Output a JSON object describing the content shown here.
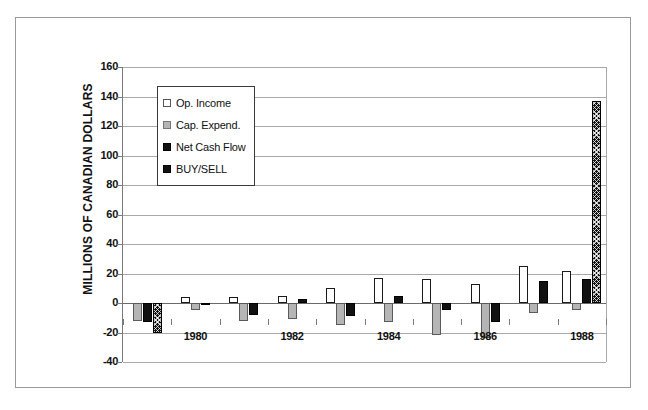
{
  "chart_data": {
    "type": "bar",
    "title": "",
    "xlabel": "",
    "ylabel": "MILLIONS OF CANADIAN DOLLARS",
    "ylim": [
      -40,
      160
    ],
    "ytick_step": 20,
    "yticks": [
      160,
      140,
      120,
      100,
      80,
      60,
      40,
      20,
      0,
      -20,
      -40
    ],
    "grid": true,
    "legend_position": "upper-left-inside",
    "categories": [
      "1979",
      "1980",
      "1981",
      "1982",
      "1983",
      "1984",
      "1985",
      "1986",
      "1987",
      "1988"
    ],
    "xtick_labels": [
      "",
      "1980",
      "",
      "1982",
      "",
      "1984",
      "",
      "1986",
      "",
      "1988"
    ],
    "series": [
      {
        "name": "Op. Income",
        "key": "op",
        "color": "#ffffff",
        "values": [
          null,
          4,
          4,
          5,
          10,
          17,
          16,
          13,
          25,
          22
        ]
      },
      {
        "name": "Cap. Expend.",
        "key": "cap",
        "color": "#b5b5b5",
        "values": [
          -12,
          -5,
          -12,
          -11,
          -15,
          -13,
          -22,
          -24,
          -7,
          -5
        ]
      },
      {
        "name": "Net Cash Flow",
        "key": "ncf",
        "color": "#111111",
        "values": [
          -13,
          -1,
          -8,
          3,
          -9,
          5,
          -5,
          -13,
          15,
          16
        ]
      },
      {
        "name": "BUY/SELL",
        "key": "buy",
        "color": "#111111",
        "values": [
          -20,
          null,
          null,
          null,
          null,
          null,
          null,
          null,
          null,
          137
        ]
      }
    ]
  },
  "legend": {
    "items": [
      {
        "label": "Op. Income",
        "swatch": "op"
      },
      {
        "label": "Cap. Expend.",
        "swatch": "cap"
      },
      {
        "label": "Net Cash Flow",
        "swatch": "ncf"
      },
      {
        "label": "BUY/SELL",
        "swatch": "buy"
      }
    ]
  }
}
